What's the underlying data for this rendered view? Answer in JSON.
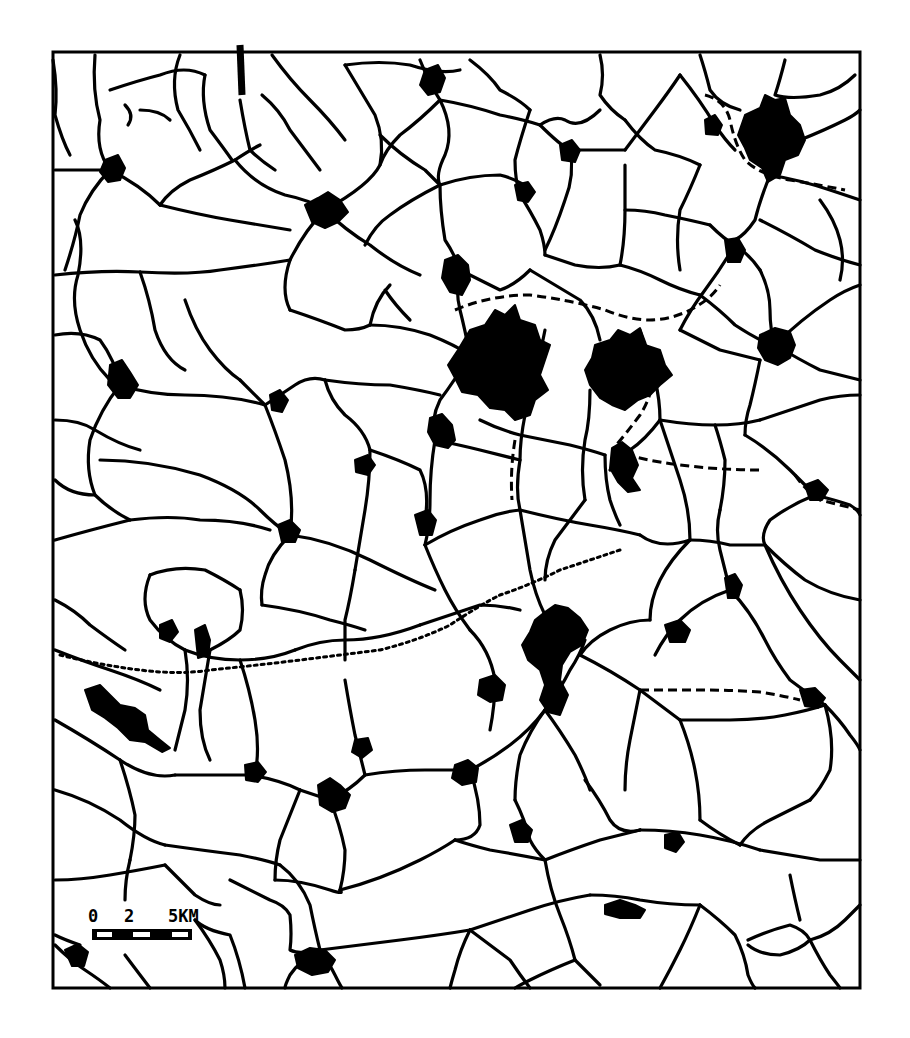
{
  "map": {
    "type": "settlement-and-road-network",
    "style": "monochrome print",
    "colors": {
      "ink": "#000000",
      "paper": "#ffffff"
    },
    "frame": {
      "x": 53,
      "y": 52,
      "width": 807,
      "height": 936
    },
    "legend": {
      "scale_bar": {
        "tick_labels": [
          "0",
          "2",
          "5KM"
        ],
        "units": "km",
        "segments": 5
      }
    },
    "features": {
      "settlements": "black filled areas",
      "roads": "solid black lines",
      "railways": "dashed lines",
      "boundary": "dotted line"
    }
  }
}
